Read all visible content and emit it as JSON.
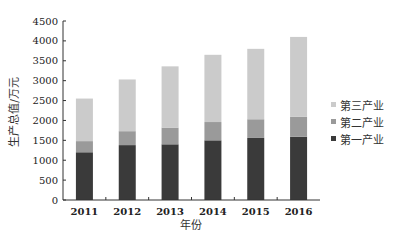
{
  "chart_data": {
    "type": "bar",
    "stacked": true,
    "title": "",
    "xlabel": "年份",
    "ylabel": "生产总值/万元",
    "categories": [
      "2011",
      "2012",
      "2013",
      "2014",
      "2015",
      "2016"
    ],
    "series": [
      {
        "name": "第一产业",
        "color": "#3a3a3a",
        "values": [
          1200,
          1380,
          1400,
          1500,
          1560,
          1590
        ]
      },
      {
        "name": "第二产业",
        "color": "#9a9a9a",
        "values": [
          280,
          350,
          420,
          460,
          470,
          500
        ]
      },
      {
        "name": "第三产业",
        "color": "#cbcbcb",
        "values": [
          1070,
          1300,
          1540,
          1690,
          1770,
          2010
        ]
      }
    ],
    "totals": [
      2550,
      3030,
      3360,
      3650,
      3800,
      4100
    ],
    "ylim": [
      0,
      4500
    ],
    "yticks": [
      0,
      500,
      1000,
      1500,
      2000,
      2500,
      3000,
      3500,
      4000,
      4500
    ],
    "grid": false,
    "legend_position": "right"
  },
  "legend": {
    "items": [
      {
        "label": "第三产业",
        "color": "#cbcbcb"
      },
      {
        "label": "第二产业",
        "color": "#9a9a9a"
      },
      {
        "label": "第一产业",
        "color": "#3a3a3a"
      }
    ]
  }
}
